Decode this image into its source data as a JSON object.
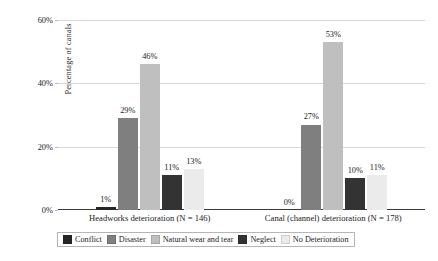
{
  "chart_data": {
    "type": "bar",
    "title": "",
    "xlabel": "",
    "ylabel": "Percentage of canals",
    "ylim": [
      0,
      60
    ],
    "yticks": [
      "0%",
      "20%",
      "40%",
      "60%"
    ],
    "ytick_values": [
      0,
      20,
      40,
      60
    ],
    "grid": true,
    "legend_position": "bottom",
    "categories": [
      "Headworks deterioration (N = 146)",
      "Canal (channel) deterioration (N = 178)"
    ],
    "series": [
      {
        "name": "Conflict",
        "values": [
          1,
          0
        ],
        "labels": [
          "1%",
          "0%"
        ],
        "color": "#262626"
      },
      {
        "name": "Disaster",
        "values": [
          29,
          27
        ],
        "labels": [
          "29%",
          "27%"
        ],
        "color": "#7f7f7f"
      },
      {
        "name": "Natural wear and tear",
        "values": [
          46,
          53
        ],
        "labels": [
          "46%",
          "53%"
        ],
        "color": "#bfbfbf"
      },
      {
        "name": "Neglect",
        "values": [
          11,
          10
        ],
        "labels": [
          "11%",
          "10%"
        ],
        "color": "#333333"
      },
      {
        "name": "No Deterioration",
        "values": [
          13,
          11
        ],
        "labels": [
          "13%",
          "11%"
        ],
        "color": "#ebebeb"
      }
    ]
  }
}
